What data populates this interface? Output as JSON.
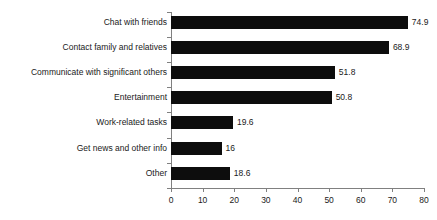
{
  "chart_data": {
    "type": "bar",
    "orientation": "horizontal",
    "title": "",
    "subtitle": "",
    "xlabel": "",
    "ylabel": "",
    "categories": [
      "Chat with friends",
      "Contact family and relatives",
      "Communicate with significant others",
      "Entertainment",
      "Work-related tasks",
      "Get news and other info",
      "Other"
    ],
    "values": [
      74.9,
      68.9,
      51.8,
      50.8,
      19.6,
      16,
      18.6
    ],
    "value_labels": [
      "74.9",
      "68.9",
      "51.8",
      "50.8",
      "19.6",
      "16",
      "18.6"
    ],
    "xlim": [
      0,
      80
    ],
    "xticks": [
      0,
      10,
      20,
      30,
      40,
      50,
      60,
      70,
      80
    ],
    "xtick_labels": [
      "0",
      "10",
      "20",
      "30",
      "40",
      "50",
      "60",
      "70",
      "80"
    ],
    "grid": false,
    "legend": null,
    "bar_color": "#0d0d0d",
    "axis_color": "#808080",
    "text_color": "#1a1a1a",
    "background": "#ffffff"
  }
}
